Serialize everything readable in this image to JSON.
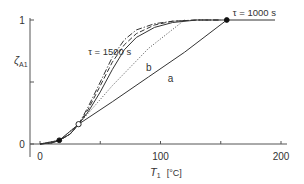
{
  "chart_data": {
    "type": "line",
    "title": "",
    "xlabel": "T1 [°C]",
    "xlabel_main": "T",
    "xlabel_sub": "1",
    "xlabel_unit": "[°C]",
    "ylabel": "ζA1",
    "ylabel_main": "ζ",
    "ylabel_sub": "A1",
    "xlim": [
      -5,
      210
    ],
    "ylim": [
      0,
      1
    ],
    "x_ticks": [
      0,
      50,
      100,
      150,
      200
    ],
    "x_tick_labels": [
      "0",
      "",
      "100",
      "",
      "200"
    ],
    "y_ticks": [
      0,
      0.5,
      1
    ],
    "y_tick_labels": [
      "0",
      "",
      "1"
    ],
    "grid": false,
    "annotations": [
      {
        "text": "τ = 1500 s",
        "x": 40,
        "y": 0.72
      },
      {
        "text": "τ = 1000 s",
        "x": 160,
        "y": 1.03
      },
      {
        "text": "b",
        "x": 88,
        "y": 0.59
      },
      {
        "text": "a",
        "x": 106,
        "y": 0.5
      }
    ],
    "markers": [
      {
        "type": "filled",
        "x": 16,
        "y": 0.03
      },
      {
        "type": "open",
        "x": 32,
        "y": 0.16
      },
      {
        "type": "filled",
        "x": 155,
        "y": 1.0
      }
    ],
    "series": [
      {
        "name": "τ = 1500 s (dash-dot)",
        "style": "dashdot",
        "x": [
          0,
          10,
          16,
          25,
          32,
          40,
          50,
          60,
          70,
          80,
          95,
          110,
          130,
          150
        ],
        "y": [
          0,
          0.01,
          0.03,
          0.08,
          0.16,
          0.3,
          0.5,
          0.7,
          0.84,
          0.92,
          0.97,
          0.99,
          1.0,
          1.0
        ]
      },
      {
        "name": "dashed",
        "style": "dashed",
        "x": [
          0,
          10,
          16,
          25,
          32,
          40,
          50,
          60,
          70,
          80,
          95,
          110,
          130,
          150
        ],
        "y": [
          0,
          0.01,
          0.03,
          0.08,
          0.16,
          0.28,
          0.47,
          0.66,
          0.8,
          0.89,
          0.96,
          0.99,
          1.0,
          1.0
        ]
      },
      {
        "name": "solid curve",
        "style": "solid",
        "x": [
          0,
          10,
          16,
          25,
          32,
          40,
          50,
          60,
          70,
          80,
          95,
          110,
          130,
          155
        ],
        "y": [
          0,
          0.01,
          0.03,
          0.08,
          0.16,
          0.26,
          0.42,
          0.6,
          0.76,
          0.86,
          0.94,
          0.98,
          1.0,
          1.0
        ]
      },
      {
        "name": "b",
        "style": "dotted",
        "x": [
          0,
          16,
          32,
          60,
          90,
          120
        ],
        "y": [
          0,
          0.03,
          0.16,
          0.47,
          0.77,
          1.0
        ]
      },
      {
        "name": "a",
        "style": "solid",
        "x": [
          0,
          16,
          32,
          60,
          90,
          120,
          155,
          195
        ],
        "y": [
          0,
          0.03,
          0.16,
          0.34,
          0.54,
          0.74,
          1.0,
          1.0
        ]
      }
    ]
  }
}
